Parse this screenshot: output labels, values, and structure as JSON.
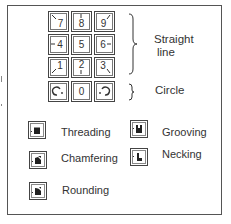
{
  "keypad": {
    "keys": [
      {
        "label": "7",
        "direction": "up-left"
      },
      {
        "label": "8",
        "direction": "up"
      },
      {
        "label": "9",
        "direction": "up-right"
      },
      {
        "label": "4",
        "direction": "left"
      },
      {
        "label": "5",
        "direction": "none"
      },
      {
        "label": "6",
        "direction": "right"
      },
      {
        "label": "1",
        "direction": "down-left"
      },
      {
        "label": "2",
        "direction": "down"
      },
      {
        "label": "3",
        "direction": "down-right"
      },
      {
        "label": "",
        "direction": "circle-ccw"
      },
      {
        "label": "0",
        "direction": "none"
      },
      {
        "label": "",
        "direction": "circle-cw"
      }
    ]
  },
  "groups": {
    "straight_line": {
      "line1": "Straight",
      "line2": "line"
    },
    "circle": {
      "label": "Circle"
    }
  },
  "operations": [
    {
      "label": "Threading",
      "icon": "threading-icon"
    },
    {
      "label": "Grooving",
      "icon": "grooving-icon"
    },
    {
      "label": "Chamfering",
      "icon": "chamfering-icon"
    },
    {
      "label": "Necking",
      "icon": "necking-icon"
    },
    {
      "label": "Rounding",
      "icon": "rounding-icon"
    }
  ]
}
